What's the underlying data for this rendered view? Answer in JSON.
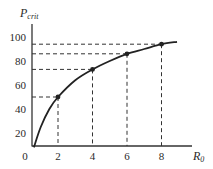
{
  "chart_data": {
    "type": "line",
    "title": "",
    "xlabel": "R0",
    "ylabel": "Pcrit",
    "xlabel_main": "R",
    "xlabel_sub": "0",
    "ylabel_main": "P",
    "ylabel_sub": "crit",
    "xlim": [
      0,
      9.5
    ],
    "ylim": [
      0,
      110
    ],
    "x_ticks": [
      "0",
      "2",
      "4",
      "6",
      "8"
    ],
    "y_ticks": [
      "20",
      "40",
      "60",
      "80",
      "100"
    ],
    "grid": false,
    "legend": null,
    "curve": {
      "description": "concave increasing saturating curve",
      "x": [
        0.6,
        1,
        1.5,
        2,
        3,
        4,
        5,
        6,
        7,
        8,
        8.9
      ],
      "y": [
        8,
        25,
        40,
        50,
        64,
        73,
        80,
        86,
        90,
        94,
        96
      ]
    },
    "marked_points": [
      {
        "x": 2,
        "y": 50
      },
      {
        "x": 4,
        "y": 73
      },
      {
        "x": 6,
        "y": 86
      },
      {
        "x": 8,
        "y": 94
      }
    ],
    "annotations": "dashed drop lines from each marked point to both axes"
  }
}
